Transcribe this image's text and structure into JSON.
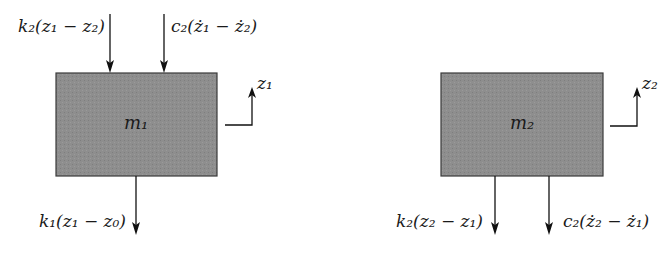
{
  "diagram": {
    "type": "free-body diagram, two-mass system",
    "mass1": {
      "label": "m₁",
      "displacement": "z₁",
      "top_forces": [
        "k₂(z₁ − z₂)",
        "c₂(ż₁ − ż₂)"
      ],
      "bottom_forces": [
        "k₁(z₁ − z₀)"
      ]
    },
    "mass2": {
      "label": "m₂",
      "displacement": "z₂",
      "bottom_forces": [
        "k₂(z₂ − z₁)",
        "c₂(ż₂ − ż₁)"
      ]
    },
    "colors": {
      "box_fill": "#8c8c8c",
      "box_stroke": "#3a3a3a",
      "arrow": "#111111"
    }
  }
}
